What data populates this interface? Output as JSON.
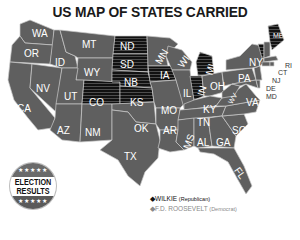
{
  "title": "US MAP OF STATES CARRIED",
  "badge": {
    "stars_top": "★★★★★",
    "line1": "ELECTION",
    "line2": "RESULTS",
    "stars_bottom": "★★★★★"
  },
  "legend": {
    "items": [
      {
        "marker": "◆",
        "name": "WILKIE",
        "party": "(Republican)",
        "color": "#111111",
        "pattern": "black-striped"
      },
      {
        "marker": "◆",
        "name": "F.D. ROOSEVELT",
        "party": "(Democrat)",
        "color": "#5f5f5f",
        "pattern": "gray"
      }
    ]
  },
  "colors": {
    "republican_fill": "#111111",
    "republican_stripe": "#555555",
    "democrat_fill": "#5f5f5f",
    "border": "#c8c8c8",
    "background": "#ffffff"
  },
  "states": {
    "WA": "WA",
    "OR": "OR",
    "CA": "CA",
    "ID": "ID",
    "NV": "NV",
    "MT": "MT",
    "WY": "WY",
    "UT": "UT",
    "AZ": "AZ",
    "NM": "NM",
    "CO": "CO",
    "ND": "ND",
    "SD": "SD",
    "NB": "NB",
    "KS": "KS",
    "OK": "OK",
    "TX": "TX",
    "MN": "MN",
    "IA": "IA",
    "MO": "MO",
    "AR": "AR",
    "LA": "LA",
    "WI": "WI",
    "IL": "IL",
    "MI": "MI",
    "IN": "IN",
    "OH": "OH",
    "KY": "KY",
    "TN": "TN",
    "MS": "MS",
    "AL": "AL",
    "GA": "GA",
    "FL": "FL",
    "SC": "SC",
    "NC": "NC",
    "VA": "VA",
    "WV": "WV",
    "PA": "PA",
    "NY": "NY",
    "VT": "VT",
    "NH": "NH",
    "ME": "ME",
    "MA": "MA",
    "RI": "RI",
    "CT": "CT",
    "NJ": "NJ",
    "DE": "DE",
    "MD": "MD"
  },
  "results": {
    "wilkie": [
      "ND",
      "SD",
      "NB",
      "KS",
      "CO",
      "IA",
      "MI",
      "IN",
      "ME",
      "VT"
    ],
    "roosevelt": [
      "WA",
      "OR",
      "CA",
      "ID",
      "NV",
      "MT",
      "WY",
      "UT",
      "AZ",
      "NM",
      "OK",
      "TX",
      "MN",
      "MO",
      "AR",
      "LA",
      "WI",
      "IL",
      "OH",
      "KY",
      "TN",
      "MS",
      "AL",
      "GA",
      "FL",
      "SC",
      "NC",
      "VA",
      "WV",
      "PA",
      "NY",
      "NH",
      "MA",
      "RI",
      "CT",
      "NJ",
      "DE",
      "MD"
    ]
  }
}
